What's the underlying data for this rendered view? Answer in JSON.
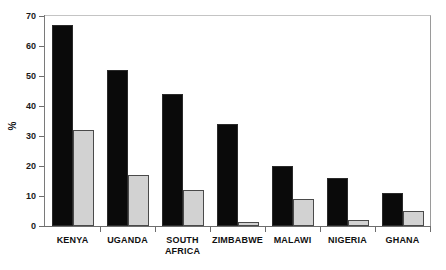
{
  "chart_data": {
    "type": "bar",
    "title": "",
    "subtitle": "",
    "xlabel": "",
    "ylabel": "%",
    "ylim": [
      0,
      70
    ],
    "ytick_step": 10,
    "yticks": [
      0,
      10,
      20,
      30,
      40,
      50,
      60,
      70
    ],
    "ytick_labels": [
      "0",
      "10",
      "20",
      "30",
      "40",
      "50",
      "60",
      "70"
    ],
    "grid": false,
    "legend": "none",
    "categories": [
      "KENYA",
      "UGANDA",
      "SOUTH\nAFRICA",
      "ZIMBABWE",
      "MALAWI",
      "NIGERIA",
      "GHANA"
    ],
    "series": [
      {
        "name": "series-1",
        "color": "#0a0a0a",
        "values": [
          67,
          52,
          44,
          34,
          20,
          16,
          11
        ]
      },
      {
        "name": "series-2",
        "color": "#d2d2d2",
        "values": [
          32,
          17,
          12,
          1.5,
          9,
          2,
          5
        ]
      }
    ]
  },
  "axis": {
    "y_label": "%"
  },
  "colors": {
    "series_dark": "#0a0a0a",
    "series_light": "#d2d2d2",
    "frame": "#b9b9b9",
    "axis": "#6d6d6d",
    "text": "#101010",
    "background": "#ffffff"
  }
}
